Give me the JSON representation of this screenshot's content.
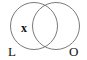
{
  "diagram": {
    "type": "venn",
    "sets": [
      {
        "id": "L",
        "label": "L"
      },
      {
        "id": "O",
        "label": "O"
      }
    ],
    "marks": [
      {
        "region": "L only",
        "text": "x"
      }
    ],
    "colors": {
      "stroke": "#7a7a7a",
      "text": "#111111",
      "background": "#ffffff"
    }
  }
}
